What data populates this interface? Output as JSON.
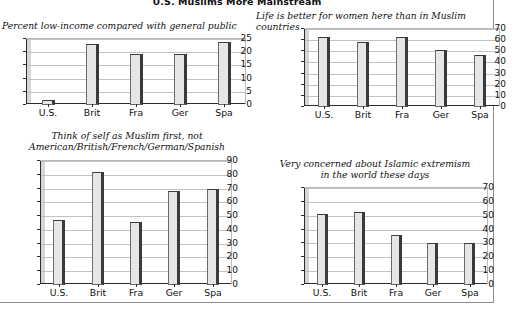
{
  "figure": {
    "title": "U.S. Muslims More Mainstream",
    "frame_color": "#8d8d8d",
    "bar_face_color": "#e6e6e6",
    "bar_edge_color": "#3a3a3a"
  },
  "charts": [
    {
      "id": "low-income",
      "type": "bar",
      "title": "Percent low-income compared with general public",
      "title_align": "left",
      "categories": [
        "U.S.",
        "Brit",
        "Fra",
        "Ger",
        "Spa"
      ],
      "values": [
        2,
        23,
        19.5,
        19.5,
        24
      ],
      "yticks": [
        0,
        5,
        10,
        15,
        20,
        25
      ],
      "ylim": [
        0,
        25
      ],
      "xlabel": "",
      "ylabel": "",
      "grid": true,
      "legend": "none"
    },
    {
      "id": "life-better-women",
      "type": "bar",
      "title": "Life is better for women here than in Muslim countries",
      "title_align": "left",
      "categories": [
        "U.S.",
        "Brit",
        "Fra",
        "Ger",
        "Spa"
      ],
      "values": [
        63,
        58,
        63,
        51,
        47
      ],
      "yticks": [
        0,
        10,
        20,
        30,
        40,
        50,
        60,
        70
      ],
      "ylim": [
        0,
        70
      ],
      "xlabel": "",
      "ylabel": "",
      "grid": true,
      "legend": "none"
    },
    {
      "id": "muslim-first",
      "type": "bar",
      "title": "Think of self as Muslim first, not\nAmerican/British/French/German/Spanish",
      "title_align": "center",
      "categories": [
        "U.S.",
        "Brit",
        "Fra",
        "Ger",
        "Spa"
      ],
      "values": [
        47,
        82,
        46,
        68,
        70
      ],
      "yticks": [
        0,
        10,
        20,
        30,
        40,
        50,
        60,
        70,
        80,
        90
      ],
      "ylim": [
        0,
        90
      ],
      "xlabel": "",
      "ylabel": "",
      "grid": true,
      "legend": "none"
    },
    {
      "id": "islamic-extremism",
      "type": "bar",
      "title": "Very concerned about Islamic extremism\nin the world these days",
      "title_align": "center",
      "categories": [
        "U.S.",
        "Brit",
        "Fra",
        "Ger",
        "Spa"
      ],
      "values": [
        51,
        53,
        36,
        30,
        30
      ],
      "yticks": [
        0,
        10,
        20,
        30,
        40,
        50,
        60,
        70
      ],
      "ylim": [
        0,
        70
      ],
      "xlabel": "",
      "ylabel": "",
      "grid": true,
      "legend": "none"
    }
  ],
  "chart_data": [
    {
      "type": "bar",
      "title": "Percent low-income compared with general public",
      "categories": [
        "U.S.",
        "Brit",
        "Fra",
        "Ger",
        "Spa"
      ],
      "values": [
        2,
        23,
        19.5,
        19.5,
        24
      ],
      "xlabel": "",
      "ylabel": "",
      "ylim": [
        0,
        25
      ],
      "yticks": [
        0,
        5,
        10,
        15,
        20,
        25
      ],
      "grid": true,
      "legend": "none"
    },
    {
      "type": "bar",
      "title": "Life is better for women here than in Muslim countries",
      "categories": [
        "U.S.",
        "Brit",
        "Fra",
        "Ger",
        "Spa"
      ],
      "values": [
        63,
        58,
        63,
        51,
        47
      ],
      "xlabel": "",
      "ylabel": "",
      "ylim": [
        0,
        70
      ],
      "yticks": [
        0,
        10,
        20,
        30,
        40,
        50,
        60,
        70
      ],
      "grid": true,
      "legend": "none"
    },
    {
      "type": "bar",
      "title": "Think of self as Muslim first, not American/British/French/German/Spanish",
      "categories": [
        "U.S.",
        "Brit",
        "Fra",
        "Ger",
        "Spa"
      ],
      "values": [
        47,
        82,
        46,
        68,
        70
      ],
      "xlabel": "",
      "ylabel": "",
      "ylim": [
        0,
        90
      ],
      "yticks": [
        0,
        10,
        20,
        30,
        40,
        50,
        60,
        70,
        80,
        90
      ],
      "grid": true,
      "legend": "none"
    },
    {
      "type": "bar",
      "title": "Very concerned about Islamic extremism in the world these days",
      "categories": [
        "U.S.",
        "Brit",
        "Fra",
        "Ger",
        "Spa"
      ],
      "values": [
        51,
        53,
        36,
        30,
        30
      ],
      "xlabel": "",
      "ylabel": "",
      "ylim": [
        0,
        70
      ],
      "yticks": [
        0,
        10,
        20,
        30,
        40,
        50,
        60,
        70
      ],
      "grid": true,
      "legend": "none"
    }
  ]
}
